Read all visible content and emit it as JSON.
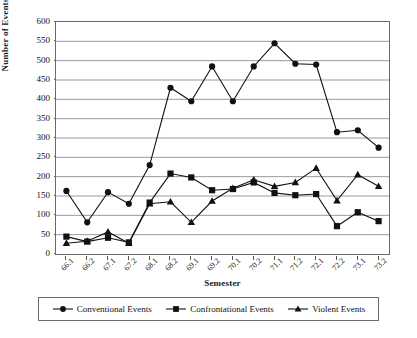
{
  "chart_data": {
    "type": "line",
    "title": "",
    "xlabel": "Semester",
    "ylabel": "Number of Events",
    "categories": [
      "66.1",
      "66.2",
      "67.1",
      "67.2",
      "68.1",
      "68.2",
      "69.1",
      "69.2",
      "70.1",
      "70.2",
      "71.1",
      "71.2",
      "72.1",
      "72.2",
      "73.1",
      "73.2"
    ],
    "ylim": [
      0,
      600
    ],
    "ytick_step": 50,
    "yticks": [
      600,
      550,
      500,
      450,
      400,
      350,
      300,
      250,
      200,
      150,
      100,
      50,
      0
    ],
    "grid": "horizontal",
    "legend_position": "bottom",
    "series": [
      {
        "name": "Conventional Events",
        "marker": "circle",
        "color": "#111111",
        "values": [
          163,
          82,
          160,
          130,
          230,
          430,
          395,
          485,
          395,
          485,
          545,
          492,
          490,
          315,
          320,
          275
        ]
      },
      {
        "name": "Confrontational Events",
        "marker": "square",
        "color": "#111111",
        "values": [
          45,
          32,
          42,
          30,
          133,
          208,
          198,
          165,
          168,
          185,
          158,
          152,
          155,
          72,
          108,
          85
        ]
      },
      {
        "name": "Violent Events",
        "marker": "triangle",
        "color": "#111111",
        "values": [
          28,
          33,
          57,
          28,
          130,
          135,
          82,
          137,
          170,
          192,
          175,
          185,
          222,
          138,
          205,
          175
        ]
      }
    ]
  },
  "legend": {
    "items": [
      {
        "label": "Conventional Events",
        "marker": "circle-marker-icon"
      },
      {
        "label": "Confrontational Events",
        "marker": "square-marker-icon"
      },
      {
        "label": "Violent Events",
        "marker": "triangle-marker-icon"
      }
    ]
  },
  "colors": {
    "series": "#111111",
    "grid": "#9a9a9a",
    "axis": "#6b6b6b",
    "background": "#ffffff"
  }
}
